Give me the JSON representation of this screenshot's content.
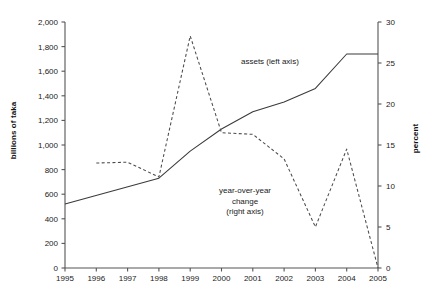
{
  "chart_data": {
    "type": "line",
    "title": "",
    "xlabel": "",
    "ylabel": "billions of taka",
    "y2label": "percent",
    "x": [
      1995,
      1996,
      1997,
      1998,
      1999,
      2000,
      2001,
      2002,
      2003,
      2004,
      2005
    ],
    "xtick_labels": [
      "1995",
      "1996",
      "1997",
      "1998",
      "1999",
      "2000",
      "2001",
      "2002",
      "2003",
      "2004",
      "2005"
    ],
    "ylim": [
      0,
      2000
    ],
    "ytick_labels": [
      "0",
      "200",
      "400",
      "600",
      "800",
      "1,000",
      "1,200",
      "1,400",
      "1,600",
      "1,800",
      "2,000"
    ],
    "ytick_values": [
      0,
      200,
      400,
      600,
      800,
      1000,
      1200,
      1400,
      1600,
      1800,
      2000
    ],
    "y2lim": [
      0,
      30
    ],
    "y2tick_labels": [
      "0",
      "5",
      "10",
      "15",
      "20",
      "25",
      "30"
    ],
    "y2tick_values": [
      0,
      5,
      10,
      15,
      20,
      25,
      30
    ],
    "grid": false,
    "legend_position": "inline-annotations",
    "series": [
      {
        "name": "assets (left axis)",
        "axis": "left",
        "style": "solid",
        "color": "#3a3a3a",
        "x": [
          1995,
          1998,
          1999,
          2000,
          2001,
          2002,
          2003,
          2004,
          2005
        ],
        "values": [
          520,
          730,
          950,
          1130,
          1270,
          1350,
          1460,
          1740,
          1740
        ]
      },
      {
        "name": "year-over-year change (right axis)",
        "axis": "right",
        "style": "dashed",
        "color": "#4a4a4a",
        "x": [
          1996,
          1997,
          1998,
          1999,
          2000,
          2001,
          2002,
          2003,
          2004,
          2005
        ],
        "values": [
          12.8,
          12.9,
          11.1,
          28.3,
          16.5,
          16.3,
          13.3,
          5.0,
          14.5,
          0.0
        ]
      }
    ],
    "annotations": [
      {
        "text": "assets (left axis)",
        "x": 2001.3,
        "y": 1560
      },
      {
        "text": "year-over-year change (right axis)",
        "x": 2000.4,
        "y": 560
      }
    ]
  },
  "labels": {
    "assets_series": "assets (left axis)",
    "yoy_line1": "year-over-year",
    "yoy_line2": "change",
    "yoy_line3": "(right axis)"
  }
}
